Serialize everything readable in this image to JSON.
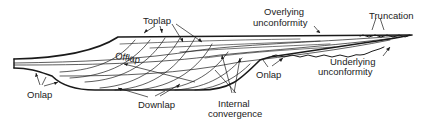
{
  "diagram": {
    "type": "stratigraphic-cross-section",
    "labels": {
      "toplap": "Toplap",
      "offlap": "Offlap",
      "onlap_left": "Onlap",
      "downlap": "Downlap",
      "internal_1": "Internal",
      "internal_2": "convergence",
      "onlap_right": "Onlap",
      "overlying_1": "Overlying",
      "overlying_2": "unconformity",
      "truncation": "Truncation",
      "underlying_1": "Underlying",
      "underlying_2": "unconformity"
    },
    "colors": {
      "line": "#1a1a1a",
      "background": "#ffffff"
    }
  }
}
